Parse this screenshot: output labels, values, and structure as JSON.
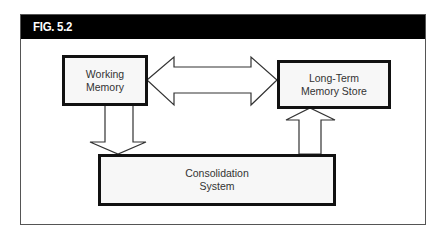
{
  "figure": {
    "label": "FIG. 5.2",
    "header_color": "#000000",
    "header_text_color": "#ffffff",
    "frame_border_color": "#555555"
  },
  "nodes": [
    {
      "id": "working-memory",
      "label": "Working\nMemory"
    },
    {
      "id": "long-term-memory-store",
      "label": "Long-Term\nMemory Store"
    },
    {
      "id": "consolidation-system",
      "label": "Consolidation\nSystem"
    }
  ],
  "edges": [
    {
      "from": "working-memory",
      "to": "long-term-memory-store",
      "type": "bidirectional-block-arrow"
    },
    {
      "from": "working-memory",
      "to": "consolidation-system",
      "type": "block-arrow-down"
    },
    {
      "from": "consolidation-system",
      "to": "long-term-memory-store",
      "type": "block-arrow-up"
    }
  ],
  "colors": {
    "node_border": "#111111",
    "node_fill": "#f7f7f7",
    "node_text": "#333333",
    "arrow_stroke": "#333333",
    "arrow_fill": "#ffffff"
  }
}
